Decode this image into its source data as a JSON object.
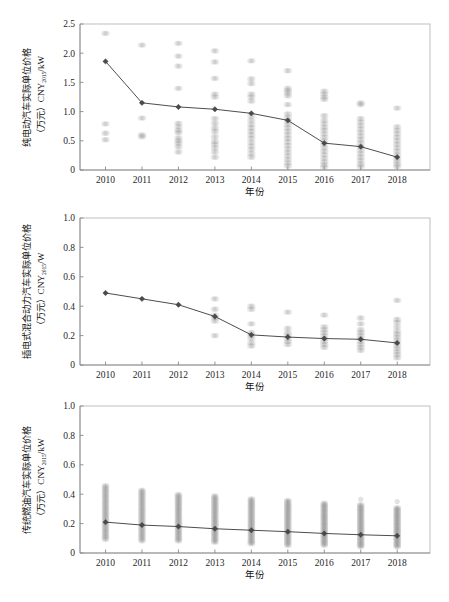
{
  "figure": {
    "panel_count": 3,
    "background": "#ffffff",
    "line_color": "#4d4d4d",
    "marker_color": "#4a4a4a",
    "scatter_color": "#9e9e9e",
    "frame_color": "#b9b9b9"
  },
  "chart_data": [
    {
      "type": "scatter",
      "panel_index": 0,
      "title": "",
      "xlabel": "年份",
      "ylabel_lines": [
        "纯电动汽车实际单位价格",
        "（万元）CNY2015/kW"
      ],
      "ylabel": "纯电动汽车实际单位价格（万元）CNY2015/kW",
      "ylabel_main": "纯电动汽车实际单位价格",
      "ylabel_unit_prefix": "（万元）CNY",
      "ylabel_unit_sub": "2015",
      "ylabel_unit_suffix": "/kW",
      "categories": [
        "2010",
        "2011",
        "2012",
        "2013",
        "2014",
        "2015",
        "2016",
        "2017",
        "2018"
      ],
      "x": [
        2010,
        2011,
        2012,
        2013,
        2014,
        2015,
        2016,
        2017,
        2018
      ],
      "xlim": [
        2009.3,
        2018.9
      ],
      "ylim": [
        0,
        2.5
      ],
      "yticks": [
        0,
        0.5,
        1.0,
        1.5,
        2.0,
        2.5
      ],
      "ytick_labels": [
        "0",
        "0.5",
        "1.0",
        "1.5",
        "2.0",
        "2.5"
      ],
      "grid": false,
      "legend": "none",
      "series": [
        {
          "name": "纯电动汽车均价",
          "marker": "diamond",
          "values": [
            1.86,
            1.15,
            1.08,
            1.04,
            0.97,
            0.85,
            0.46,
            0.4,
            0.22
          ]
        }
      ],
      "scatter": [
        {
          "year": 2010,
          "values": [
            2.34,
            0.79,
            0.63,
            0.52
          ]
        },
        {
          "year": 2011,
          "values": [
            2.14,
            0.89,
            0.6,
            0.57
          ]
        },
        {
          "year": 2012,
          "values": [
            2.17,
            1.95,
            1.78,
            1.4,
            0.8,
            0.74,
            0.68,
            0.64,
            0.55,
            0.5,
            0.46,
            0.4,
            0.31
          ]
        },
        {
          "year": 2013,
          "values": [
            2.04,
            1.85,
            1.57,
            1.3,
            1.25,
            0.88,
            0.8,
            0.72,
            0.66,
            0.57,
            0.49,
            0.44,
            0.38,
            0.31,
            0.22
          ]
        },
        {
          "year": 2014,
          "values": [
            1.87,
            1.56,
            1.48,
            1.3,
            1.25,
            1.18,
            0.92,
            0.85,
            0.78,
            0.72,
            0.66,
            0.6,
            0.54,
            0.47,
            0.41,
            0.35,
            0.28,
            0.22
          ]
        },
        {
          "year": 2015,
          "values": [
            1.7,
            1.4,
            1.36,
            1.32,
            1.27,
            1.12,
            0.96,
            0.9,
            0.84,
            0.78,
            0.72,
            0.66,
            0.6,
            0.54,
            0.48,
            0.42,
            0.36,
            0.3,
            0.24,
            0.18,
            0.12,
            0.07
          ]
        },
        {
          "year": 2016,
          "values": [
            1.35,
            1.3,
            1.25,
            1.21,
            0.93,
            0.85,
            0.79,
            0.73,
            0.68,
            0.62,
            0.56,
            0.5,
            0.44,
            0.38,
            0.32,
            0.26,
            0.2,
            0.14,
            0.09,
            0.05
          ]
        },
        {
          "year": 2017,
          "values": [
            1.15,
            1.12,
            0.88,
            0.82,
            0.76,
            0.7,
            0.64,
            0.58,
            0.52,
            0.46,
            0.4,
            0.34,
            0.28,
            0.22,
            0.16,
            0.1,
            0.06
          ]
        },
        {
          "year": 2018,
          "values": [
            1.06,
            0.74,
            0.68,
            0.62,
            0.56,
            0.5,
            0.44,
            0.38,
            0.32,
            0.26,
            0.2,
            0.15,
            0.1,
            0.06
          ]
        }
      ]
    },
    {
      "type": "scatter",
      "panel_index": 1,
      "title": "",
      "xlabel": "年份",
      "ylabel_lines": [
        "插电式混合动力汽车实际单位价格",
        "（万元）CNY2015/W"
      ],
      "ylabel": "插电式混合动力汽车实际单位价格（万元）CNY2015/W",
      "ylabel_main": "插电式混合动力汽车实际单位价格",
      "ylabel_unit_prefix": "（万元）CNY",
      "ylabel_unit_sub": "2015",
      "ylabel_unit_suffix": "/W",
      "categories": [
        "2010",
        "2011",
        "2012",
        "2013",
        "2014",
        "2015",
        "2016",
        "2017",
        "2018"
      ],
      "x": [
        2010,
        2011,
        2012,
        2013,
        2014,
        2015,
        2016,
        2017,
        2018
      ],
      "xlim": [
        2009.3,
        2018.9
      ],
      "ylim": [
        0,
        1.0
      ],
      "yticks": [
        0,
        0.2,
        0.4,
        0.6,
        0.8,
        1.0
      ],
      "ytick_labels": [
        "0",
        "0.2",
        "0.4",
        "0.6",
        "0.8",
        "1.0"
      ],
      "grid": false,
      "legend": "none",
      "series": [
        {
          "name": "插电式混合动力汽车均价",
          "marker": "diamond",
          "values": [
            0.49,
            0.45,
            0.41,
            0.33,
            0.205,
            0.19,
            0.18,
            0.175,
            0.15
          ]
        }
      ],
      "scatter": [
        {
          "year": 2010,
          "values": []
        },
        {
          "year": 2011,
          "values": []
        },
        {
          "year": 2012,
          "values": []
        },
        {
          "year": 2013,
          "values": [
            0.45,
            0.38,
            0.34,
            0.32,
            0.3,
            0.2
          ]
        },
        {
          "year": 2014,
          "values": [
            0.4,
            0.38,
            0.28,
            0.22,
            0.2,
            0.18,
            0.15,
            0.13
          ]
        },
        {
          "year": 2015,
          "values": [
            0.36,
            0.25,
            0.22,
            0.2,
            0.18,
            0.16,
            0.14
          ]
        },
        {
          "year": 2016,
          "values": [
            0.34,
            0.26,
            0.24,
            0.22,
            0.2,
            0.18,
            0.16,
            0.14,
            0.12
          ]
        },
        {
          "year": 2017,
          "values": [
            0.32,
            0.28,
            0.24,
            0.22,
            0.2,
            0.18,
            0.16,
            0.14,
            0.12,
            0.1
          ]
        },
        {
          "year": 2018,
          "values": [
            0.44,
            0.31,
            0.29,
            0.26,
            0.23,
            0.21,
            0.19,
            0.17,
            0.15,
            0.13,
            0.11,
            0.09,
            0.07,
            0.05
          ]
        }
      ]
    },
    {
      "type": "scatter",
      "panel_index": 2,
      "title": "",
      "xlabel": "年份",
      "ylabel_lines": [
        "传统燃油汽车实际单位价格",
        "（万元）CNY2015/kW"
      ],
      "ylabel": "传统燃油汽车实际单位价格（万元）CNY2015/kW",
      "ylabel_main": "传统燃油汽车实际单位价格",
      "ylabel_unit_prefix": "（万元）CNY",
      "ylabel_unit_sub": "2015",
      "ylabel_unit_suffix": "/kW",
      "categories": [
        "2010",
        "2011",
        "2012",
        "2013",
        "2014",
        "2015",
        "2016",
        "2017",
        "2018"
      ],
      "x": [
        2010,
        2011,
        2012,
        2013,
        2014,
        2015,
        2016,
        2017,
        2018
      ],
      "xlim": [
        2009.3,
        2018.9
      ],
      "ylim": [
        0,
        1.0
      ],
      "yticks": [
        0,
        0.2,
        0.4,
        0.6,
        0.8,
        1.0
      ],
      "ytick_labels": [
        "0",
        "0.2",
        "0.4",
        "0.6",
        "0.8",
        "1.0"
      ],
      "grid": false,
      "legend": "none",
      "series": [
        {
          "name": "传统燃油汽车均价",
          "marker": "diamond",
          "values": [
            0.21,
            0.19,
            0.18,
            0.165,
            0.155,
            0.145,
            0.133,
            0.124,
            0.117
          ]
        }
      ],
      "scatter_bands": [
        {
          "year": 2010,
          "low": 0.09,
          "high": 0.46
        },
        {
          "year": 2011,
          "low": 0.08,
          "high": 0.43
        },
        {
          "year": 2012,
          "low": 0.08,
          "high": 0.4
        },
        {
          "year": 2013,
          "low": 0.07,
          "high": 0.39
        },
        {
          "year": 2014,
          "low": 0.06,
          "high": 0.37
        },
        {
          "year": 2015,
          "low": 0.05,
          "high": 0.36
        },
        {
          "year": 2016,
          "low": 0.05,
          "high": 0.34
        },
        {
          "year": 2017,
          "low": 0.04,
          "high": 0.33,
          "outliers": [
            0.365
          ]
        },
        {
          "year": 2018,
          "low": 0.04,
          "high": 0.31,
          "outliers": [
            0.35
          ]
        }
      ]
    }
  ]
}
